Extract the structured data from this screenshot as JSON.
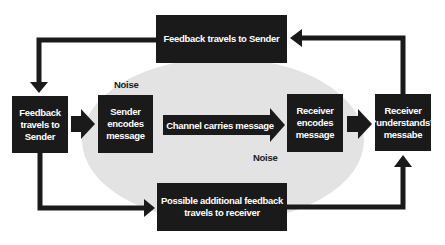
{
  "diagram": {
    "type": "communication-model-flowchart",
    "background_ellipse_color": "#e3e3e3",
    "box_color": "#1a1a1a",
    "text_color": "#ffffff",
    "nodes": {
      "top_feedback": "Feedback travels to Sender",
      "left_feedback": "Feedback travels to Sender",
      "sender": "Sender encodes message",
      "channel": "Channel carries message",
      "receiver_encodes": "Receiver encodes message",
      "receiver_understands": "Receiver “understands” messabe",
      "bottom_feedback": "Possible additional feedback travels to receiver"
    },
    "noise_labels": [
      "Noise",
      "Noise"
    ],
    "edges": [
      {
        "from": "receiver_understands",
        "to": "top_feedback"
      },
      {
        "from": "top_feedback",
        "to": "left_feedback"
      },
      {
        "from": "left_feedback",
        "to": "sender"
      },
      {
        "from": "sender",
        "to": "receiver_encodes",
        "via": "channel"
      },
      {
        "from": "receiver_encodes",
        "to": "receiver_understands"
      },
      {
        "from": "left_feedback",
        "to": "bottom_feedback"
      },
      {
        "from": "bottom_feedback",
        "to": "receiver_understands"
      }
    ]
  }
}
